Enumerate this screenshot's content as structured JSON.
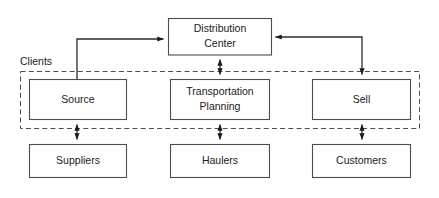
{
  "figure": {
    "type": "block-flow-diagram",
    "background_color": "#ffffff",
    "rule_color": "#7a7a7a",
    "box_stroke_color": "#4d4d4d",
    "box_fill_color": "#ffffff",
    "arrow_color": "#1a1a1a",
    "dashed_border_color": "#4d4d4d",
    "text_color": "#1a1a1a"
  },
  "rules": {
    "top_rule": "",
    "bottom_rule": ""
  },
  "group": {
    "label": "Clients",
    "style": "dashed"
  },
  "nodes": {
    "distribution_center": {
      "line1": "Distribution",
      "line2": "Center"
    },
    "source": {
      "line1": "Source",
      "line2": ""
    },
    "transportation_planning": {
      "line1": "Transportation",
      "line2": "Planning"
    },
    "sell": {
      "line1": "Sell",
      "line2": ""
    },
    "suppliers": {
      "line1": "Suppliers",
      "line2": ""
    },
    "haulers": {
      "line1": "Haulers",
      "line2": ""
    },
    "customers": {
      "line1": "Customers",
      "line2": ""
    }
  },
  "edges": [
    {
      "name": "source-to-distribution-center",
      "from": "source",
      "to": "distribution_center",
      "arrows": "single",
      "route": "elbow-up-right"
    },
    {
      "name": "distribution-center-to-sell",
      "from": "distribution_center",
      "to": "sell",
      "arrows": "single",
      "route": "elbow-right-down"
    },
    {
      "name": "distribution-center-transportation-planning",
      "from": "distribution_center",
      "to": "transportation_planning",
      "arrows": "double",
      "route": "vertical"
    },
    {
      "name": "source-suppliers",
      "from": "source",
      "to": "suppliers",
      "arrows": "double",
      "route": "vertical"
    },
    {
      "name": "transportation-planning-haulers",
      "from": "transportation_planning",
      "to": "haulers",
      "arrows": "double",
      "route": "vertical"
    },
    {
      "name": "sell-customers",
      "from": "sell",
      "to": "customers",
      "arrows": "double",
      "route": "vertical"
    }
  ]
}
